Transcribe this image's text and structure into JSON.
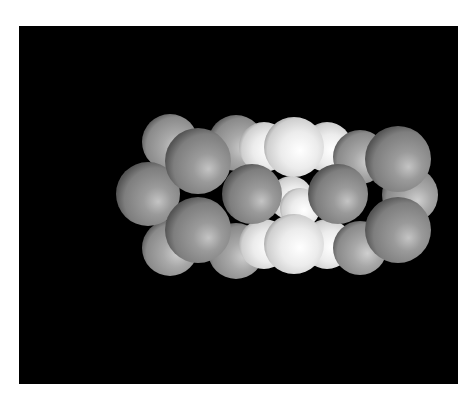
{
  "figure": {
    "background_color": "#000000",
    "page_color": "#ffffff",
    "frame": {
      "x": 19,
      "y": 26,
      "width": 439,
      "height": 358
    }
  },
  "atoms": {
    "colors": {
      "gray": "#8c8c8c",
      "gray_back": "#9a9a9a",
      "white": "#e6e6e6"
    },
    "back": [
      {
        "cx": 151,
        "cy": 116,
        "r": 28,
        "type": "gray_back"
      },
      {
        "cx": 217,
        "cy": 117,
        "r": 28,
        "type": "gray_back"
      },
      {
        "cx": 245,
        "cy": 121,
        "r": 25,
        "type": "white"
      },
      {
        "cx": 308,
        "cy": 121,
        "r": 25,
        "type": "white"
      },
      {
        "cx": 341,
        "cy": 131,
        "r": 27,
        "type": "gray_back"
      },
      {
        "cx": 391,
        "cy": 169,
        "r": 28,
        "type": "gray_back"
      },
      {
        "cx": 151,
        "cy": 222,
        "r": 28,
        "type": "gray_back"
      },
      {
        "cx": 217,
        "cy": 225,
        "r": 28,
        "type": "gray_back"
      },
      {
        "cx": 245,
        "cy": 218,
        "r": 25,
        "type": "white"
      },
      {
        "cx": 308,
        "cy": 218,
        "r": 25,
        "type": "white"
      },
      {
        "cx": 341,
        "cy": 222,
        "r": 27,
        "type": "gray_back"
      },
      {
        "cx": 272,
        "cy": 172,
        "r": 22,
        "type": "white"
      },
      {
        "cx": 281,
        "cy": 182,
        "r": 20,
        "type": "white"
      }
    ],
    "middle": [
      {
        "cx": 275,
        "cy": 121,
        "r": 30,
        "type": "white"
      },
      {
        "cx": 275,
        "cy": 218,
        "r": 30,
        "type": "white"
      },
      {
        "cx": 129,
        "cy": 168,
        "r": 32,
        "type": "gray"
      }
    ],
    "front": [
      {
        "cx": 179,
        "cy": 135,
        "r": 33,
        "type": "gray"
      },
      {
        "cx": 179,
        "cy": 204,
        "r": 33,
        "type": "gray"
      },
      {
        "cx": 233,
        "cy": 168,
        "r": 30,
        "type": "gray"
      },
      {
        "cx": 319,
        "cy": 168,
        "r": 30,
        "type": "gray"
      },
      {
        "cx": 379,
        "cy": 133,
        "r": 33,
        "type": "gray"
      },
      {
        "cx": 379,
        "cy": 204,
        "r": 33,
        "type": "gray"
      }
    ]
  }
}
